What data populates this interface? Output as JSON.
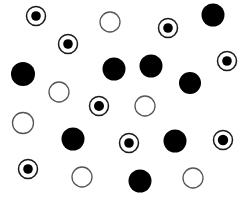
{
  "image": {
    "kind": "dot-pattern-stimulus",
    "width": 246,
    "height": 200,
    "background_color": "#ffffff",
    "ink_color": "#000000",
    "outline_color": "#4d4d4d",
    "description": "Scattered circular markers of three kinds on a plain white field",
    "marker_kinds": [
      {
        "id": "bullseye",
        "label": "bullseye",
        "icon_name": "bullseye-circle-icon",
        "count": 8,
        "fill": "#ffffff",
        "stroke": "#1a1a1a",
        "inner_fill": "#000000"
      },
      {
        "id": "filled",
        "label": "filled",
        "icon_name": "filled-circle-icon",
        "count": 8,
        "fill": "#000000",
        "stroke": "#000000",
        "inner_fill": "#000000"
      },
      {
        "id": "hollow",
        "label": "hollow",
        "icon_name": "hollow-circle-icon",
        "count": 6,
        "fill": "#ffffff",
        "stroke": "#555555",
        "inner_fill": "none"
      }
    ]
  },
  "chart_data": {
    "type": "scatter",
    "title": "",
    "subtitle": "",
    "xlabel": "",
    "ylabel": "",
    "xlim": [
      0,
      246
    ],
    "ylim": [
      0,
      200
    ],
    "grid": false,
    "axes_visible": false,
    "legend": false,
    "legend_position": "none",
    "annotations": [],
    "tick_labels_x": [],
    "tick_labels_y": [],
    "series": [
      {
        "name": "bullseye",
        "marker": "bullseye",
        "count": 8,
        "color": "#000000",
        "points": [
          {
            "x": 36,
            "y": 16,
            "r": 9.5,
            "inner_r": 4.8
          },
          {
            "x": 68,
            "y": 44,
            "r": 9.5,
            "inner_r": 4.8
          },
          {
            "x": 168,
            "y": 28,
            "r": 9.5,
            "inner_r": 4.8
          },
          {
            "x": 227,
            "y": 61,
            "r": 9.5,
            "inner_r": 4.8
          },
          {
            "x": 99,
            "y": 106,
            "r": 9.5,
            "inner_r": 5.0
          },
          {
            "x": 129,
            "y": 143,
            "r": 9.5,
            "inner_r": 4.8
          },
          {
            "x": 223,
            "y": 140,
            "r": 9.5,
            "inner_r": 5.2
          },
          {
            "x": 28,
            "y": 169,
            "r": 9.5,
            "inner_r": 4.8
          }
        ]
      },
      {
        "name": "filled",
        "marker": "filled",
        "count": 8,
        "color": "#000000",
        "points": [
          {
            "x": 213,
            "y": 15,
            "r": 11.5
          },
          {
            "x": 23,
            "y": 74,
            "r": 12.0
          },
          {
            "x": 114,
            "y": 69,
            "r": 11.5
          },
          {
            "x": 151,
            "y": 66,
            "r": 11.5
          },
          {
            "x": 190,
            "y": 83,
            "r": 11.0
          },
          {
            "x": 73,
            "y": 139,
            "r": 11.5
          },
          {
            "x": 175,
            "y": 141,
            "r": 11.5
          },
          {
            "x": 140,
            "y": 181,
            "r": 11.5
          }
        ]
      },
      {
        "name": "hollow",
        "marker": "hollow",
        "count": 6,
        "color": "#555555",
        "points": [
          {
            "x": 110,
            "y": 22,
            "r": 10.0
          },
          {
            "x": 59,
            "y": 92,
            "r": 10.0
          },
          {
            "x": 145,
            "y": 106,
            "r": 10.0
          },
          {
            "x": 23,
            "y": 123,
            "r": 10.5
          },
          {
            "x": 82,
            "y": 177,
            "r": 10.0
          },
          {
            "x": 193,
            "y": 178,
            "r": 10.0
          }
        ]
      }
    ]
  }
}
